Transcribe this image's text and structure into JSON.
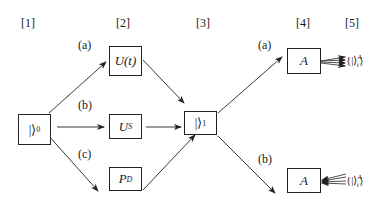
{
  "stages": [
    {
      "label": "[1]"
    },
    {
      "label": "[2]"
    },
    {
      "label": "[3]"
    },
    {
      "label": "[4]"
    },
    {
      "label": "[5]"
    }
  ],
  "branches_left": [
    {
      "label": "(a)"
    },
    {
      "label": "(b)"
    },
    {
      "label": "(c)"
    }
  ],
  "branches_right": [
    {
      "label": "(a)"
    },
    {
      "label": "(b)"
    }
  ],
  "nodes": {
    "initial_state": {
      "main": "|⟩",
      "sub": "0"
    },
    "unitary_time": {
      "main": "U(t)"
    },
    "unitary_s": {
      "main": "U",
      "sub": "S"
    },
    "projector_d": {
      "main": "P",
      "sub": "D"
    },
    "final_state": {
      "main": "|⟩",
      "sub": "1"
    },
    "observable_a_top": {
      "main": "A"
    },
    "observable_a_bottom": {
      "main": "A"
    }
  },
  "outcomes": {
    "top": {
      "brace_open": "{",
      "ket": "|⟩",
      "sup": "A",
      "sub": "i",
      "brace_close": "}"
    },
    "bottom": {
      "brace_open": "{",
      "ket": "|⟩",
      "sup": "A",
      "sub": "i",
      "brace_close": "}"
    }
  },
  "colors": {
    "line": "#222222",
    "background": "#ffffff"
  }
}
